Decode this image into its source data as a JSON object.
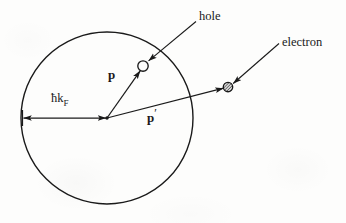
{
  "figure": {
    "type": "physics-diagram",
    "width": 346,
    "height": 223,
    "background_color": "#fdfdfc",
    "ink_color": "#1a1a1a"
  },
  "fermi_sphere": {
    "name": "Fermi sphere",
    "center_x": 107,
    "center_y": 118,
    "radius": 86,
    "stroke_color": "#1a1a1a",
    "stroke_width": 1.4,
    "fill": "none"
  },
  "labels": {
    "hole": "hole",
    "electron": "electron",
    "momentum_p": "p",
    "momentum_p_prime_base": "p",
    "momentum_p_prime_mark": "′",
    "fermi_momentum_base": "ħk",
    "fermi_momentum_sub": "F"
  },
  "markers": {
    "hole": {
      "name": "hole-marker",
      "style": "open-circle",
      "cx": 143,
      "cy": 66,
      "r": 5.2,
      "fill": "#fdfdfc",
      "stroke": "#1a1a1a"
    },
    "electron": {
      "name": "electron-marker",
      "style": "hatched-filled-circle",
      "cx": 228,
      "cy": 87,
      "r": 4.6,
      "fill": "#8c8c8c",
      "stroke": "#1a1a1a"
    },
    "origin": {
      "name": "origin-point",
      "cx": 107,
      "cy": 118,
      "r": 1.6
    }
  },
  "vectors": {
    "p": {
      "name": "momentum-vector-p",
      "from_x": 107,
      "from_y": 118,
      "to_x": 140,
      "to_y": 70,
      "arrowhead": true
    },
    "p_prime": {
      "name": "momentum-vector-p-prime",
      "from_x": 107,
      "from_y": 118,
      "to_x": 224,
      "to_y": 88,
      "arrowhead": true
    },
    "fermi_radius": {
      "name": "fermi-radius-double-arrow",
      "from_x": 107,
      "from_y": 118,
      "to_x": 23,
      "to_y": 118,
      "arrowhead_both": true
    }
  },
  "leaders": {
    "hole": {
      "name": "hole-leader-line",
      "from_x": 196,
      "from_y": 22,
      "to_x": 148,
      "to_y": 61
    },
    "electron": {
      "name": "electron-leader-line",
      "from_x": 279,
      "from_y": 44,
      "to_x": 233,
      "to_y": 84
    }
  }
}
